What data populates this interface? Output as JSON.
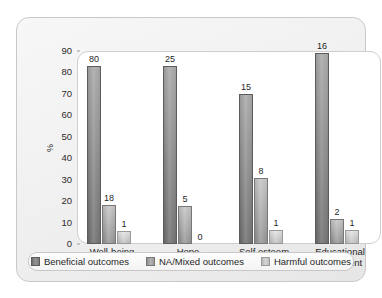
{
  "chart_data": {
    "type": "bar",
    "title": "",
    "xlabel": "",
    "ylabel": "%",
    "ylim": [
      0,
      90
    ],
    "ytick_step": 10,
    "yticks": [
      0,
      10,
      20,
      30,
      40,
      50,
      60,
      70,
      80,
      90
    ],
    "grid": false,
    "legend_position": "bottom",
    "categories": [
      "Well-being",
      "Hope",
      "Self esteem",
      "Educational attainment"
    ],
    "series": [
      {
        "name": "Beneficial outcomes",
        "color": "#8a8a8a",
        "labels": [
          "80",
          "25",
          "15",
          "16"
        ],
        "values": [
          83,
          83,
          70,
          89
        ]
      },
      {
        "name": "NA/Mixed outcomes",
        "color": "#ababab",
        "labels": [
          "18",
          "5",
          "8",
          "2"
        ],
        "values": [
          18,
          17.5,
          31,
          11.5
        ]
      },
      {
        "name": "Harmful outcomes",
        "color": "#cccccc",
        "labels": [
          "1",
          "0",
          "1",
          "1"
        ],
        "values": [
          6,
          0,
          6.5,
          6.5
        ]
      }
    ]
  },
  "axis": {
    "y_title": "%"
  },
  "legend": {
    "items": [
      {
        "label": "Beneficial outcomes"
      },
      {
        "label": "NA/Mixed outcomes"
      },
      {
        "label": "Harmful outcomes"
      }
    ]
  }
}
